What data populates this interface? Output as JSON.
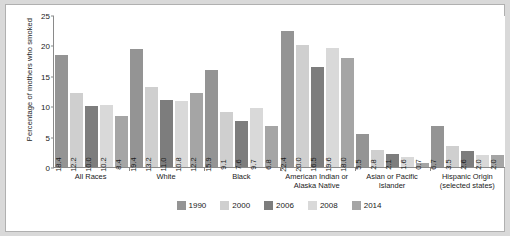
{
  "chart_data": {
    "type": "bar",
    "title": "",
    "xlabel": "",
    "ylabel": "Percentage of mothers who smoked",
    "ylim": [
      0,
      25
    ],
    "yticks": [
      "0",
      "5",
      "10",
      "15",
      "20",
      "25"
    ],
    "grid": false,
    "legend_position": "bottom",
    "categories": [
      "All Races",
      "White",
      "Black",
      "American Indian or Alaska Native",
      "Asian or Pacific Islander",
      "Hispanic Origin (selected states)"
    ],
    "series": [
      {
        "name": "1990",
        "color": "#949494",
        "values": [
          18.4,
          19.4,
          15.9,
          22.4,
          5.5,
          6.7
        ]
      },
      {
        "name": "2000",
        "color": "#cfcfcf",
        "values": [
          12.2,
          13.2,
          9.1,
          20.0,
          2.8,
          3.5
        ]
      },
      {
        "name": "2006",
        "color": "#7d7d7d",
        "values": [
          10.0,
          11.0,
          7.6,
          16.5,
          2.1,
          2.6
        ]
      },
      {
        "name": "2008",
        "color": "#d9d9d9",
        "values": [
          10.2,
          10.8,
          9.7,
          19.6,
          1.6,
          2.0
        ]
      },
      {
        "name": "2014",
        "color": "#a5a5a5",
        "values": [
          8.4,
          12.2,
          6.8,
          18.0,
          0.7,
          2.0
        ]
      }
    ],
    "value_labels": [
      [
        "18.4",
        "12.2",
        "10.0",
        "10.2",
        "8.4"
      ],
      [
        "19.4",
        "13.2",
        "11.0",
        "10.8",
        "12.2"
      ],
      [
        "15.9",
        "9.1",
        "7.6",
        "9.7",
        "6.8"
      ],
      [
        "22.4",
        "20.0",
        "16.5",
        "19.6",
        "18.0"
      ],
      [
        "5.5",
        "2.8",
        "2.1",
        "1.6",
        "0.7"
      ],
      [
        "6.7",
        "3.5",
        "2.6",
        "2.0",
        "2.0"
      ]
    ],
    "category_lines": [
      [
        "All Races"
      ],
      [
        "White"
      ],
      [
        "Black"
      ],
      [
        "American Indian or",
        "Alaska Native"
      ],
      [
        "Asian or Pacific",
        "Islander"
      ],
      [
        "Hispanic Origin",
        "(selected states)"
      ]
    ]
  }
}
